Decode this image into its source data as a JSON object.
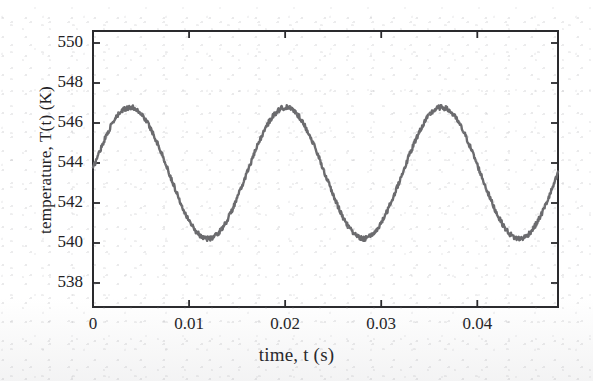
{
  "figure": {
    "kind": "scanned-journal-figure",
    "background_color": "#ffffff",
    "ink_color": "#222225",
    "curve_color": "#6b6b6e"
  },
  "chart_data": {
    "type": "line",
    "title": "",
    "subtitle": "",
    "xlabel": "time, t (s)",
    "ylabel": "temperature, T(t) (K)",
    "xlim": [
      0,
      0.0484
    ],
    "ylim": [
      536.8,
      550.6
    ],
    "xticks": [
      0,
      0.01,
      0.02,
      0.03,
      0.04
    ],
    "xticklabels": [
      "0",
      "0.01",
      "0.02",
      "0.03",
      "0.04"
    ],
    "yticks": [
      538,
      540,
      542,
      544,
      546,
      548,
      550
    ],
    "yticklabels": [
      "538",
      "540",
      "542",
      "544",
      "546",
      "548",
      "550"
    ],
    "grid": false,
    "legend": null,
    "annotations": [],
    "series": [
      {
        "name": "T(t)",
        "color": "#6b6b6e",
        "linewidth": 2.4,
        "description": "noisy sinusoidal temperature oscillation",
        "model": {
          "mean_K": 543.5,
          "amplitude_K": 3.28,
          "period_s": 0.0162,
          "frequency_Hz": 61.7,
          "phase_rad": 0.07,
          "noise_amplitude_K": 0.12
        },
        "features": {
          "start_point": {
            "t": 0.0,
            "T": 543.7
          },
          "end_point": {
            "t": 0.0484,
            "T": 543.8
          },
          "peaks": [
            {
              "t": 0.0037,
              "T": 546.78
            },
            {
              "t": 0.0199,
              "T": 546.78
            },
            {
              "t": 0.0361,
              "T": 546.8
            }
          ],
          "troughs": [
            {
              "t": 0.0118,
              "T": 540.25
            },
            {
              "t": 0.028,
              "T": 540.22
            },
            {
              "t": 0.0442,
              "T": 540.25
            }
          ]
        },
        "x": [
          0.0,
          0.0005,
          0.001,
          0.0015,
          0.002,
          0.0025,
          0.003,
          0.0035,
          0.004,
          0.0045,
          0.005,
          0.0055,
          0.006,
          0.0065,
          0.007,
          0.0075,
          0.008,
          0.0085,
          0.009,
          0.0095,
          0.01,
          0.0105,
          0.011,
          0.0115,
          0.012,
          0.0125,
          0.013,
          0.0135,
          0.014,
          0.0145,
          0.015,
          0.0155,
          0.016,
          0.0165,
          0.017,
          0.0175,
          0.018,
          0.0185,
          0.019,
          0.0195,
          0.02,
          0.0205,
          0.021,
          0.0215,
          0.022,
          0.0225,
          0.023,
          0.0235,
          0.024,
          0.0245,
          0.025,
          0.0255,
          0.026,
          0.0265,
          0.027,
          0.0275,
          0.028,
          0.0285,
          0.029,
          0.0295,
          0.03,
          0.0305,
          0.031,
          0.0315,
          0.032,
          0.0325,
          0.033,
          0.0335,
          0.034,
          0.0345,
          0.035,
          0.0355,
          0.036,
          0.0365,
          0.037,
          0.0375,
          0.038,
          0.0385,
          0.039,
          0.0395,
          0.04,
          0.0405,
          0.041,
          0.0415,
          0.042,
          0.0425,
          0.043,
          0.0435,
          0.044,
          0.0445,
          0.045,
          0.0455,
          0.046,
          0.0465,
          0.047,
          0.0475,
          0.048,
          0.0484
        ],
        "y": [
          543.72,
          544.32,
          544.89,
          545.42,
          545.9,
          546.29,
          546.57,
          546.73,
          546.78,
          546.72,
          546.53,
          546.24,
          545.85,
          545.36,
          544.8,
          544.19,
          543.54,
          542.88,
          542.25,
          541.67,
          541.16,
          540.76,
          540.47,
          540.3,
          540.25,
          540.34,
          540.55,
          540.88,
          541.32,
          541.85,
          542.45,
          543.1,
          543.77,
          544.41,
          545.0,
          545.54,
          546.01,
          546.38,
          546.63,
          546.76,
          546.78,
          546.66,
          546.42,
          546.07,
          545.62,
          545.08,
          544.47,
          543.82,
          543.16,
          542.51,
          541.9,
          541.36,
          540.92,
          540.58,
          540.36,
          540.25,
          540.22,
          540.38,
          540.66,
          541.05,
          541.54,
          542.11,
          542.73,
          543.39,
          544.04,
          544.66,
          545.23,
          545.73,
          546.15,
          546.48,
          546.7,
          546.79,
          546.8,
          546.7,
          546.49,
          546.17,
          545.76,
          545.26,
          544.68,
          544.06,
          543.41,
          542.76,
          542.14,
          541.58,
          541.1,
          540.72,
          540.45,
          540.29,
          540.25,
          540.33,
          540.53,
          540.85,
          541.28,
          541.8,
          542.39,
          543.03,
          543.68,
          543.82
        ]
      }
    ]
  },
  "axes": {
    "frame": {
      "left_px": 93,
      "right_px": 558,
      "top_px": 31,
      "bottom_px": 307
    },
    "tick_direction": "in"
  }
}
